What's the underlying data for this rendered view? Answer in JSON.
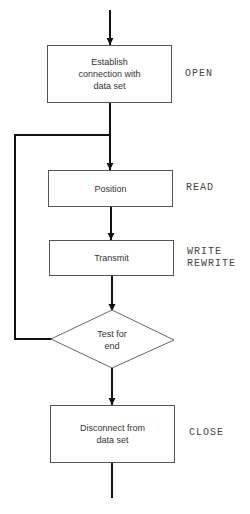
{
  "diagram": {
    "type": "flowchart",
    "nodes": [
      {
        "id": "establish",
        "shape": "rect",
        "text": "Establish connection with data set",
        "lines": [
          "Establish",
          "connection with",
          "data set"
        ],
        "annotation": "OPEN"
      },
      {
        "id": "position",
        "shape": "rect",
        "text": "Position",
        "annotation": "READ"
      },
      {
        "id": "transmit",
        "shape": "rect",
        "text": "Transmit",
        "annotation_lines": [
          "WRITE",
          "REWRITE"
        ]
      },
      {
        "id": "test",
        "shape": "diamond",
        "lines": [
          "Test for",
          "end"
        ]
      },
      {
        "id": "disconnect",
        "shape": "rect",
        "lines": [
          "Disconnect from",
          "data set"
        ],
        "annotation": "CLOSE"
      }
    ],
    "edges": [
      {
        "from": "start",
        "to": "establish"
      },
      {
        "from": "establish",
        "to": "position"
      },
      {
        "from": "position",
        "to": "transmit"
      },
      {
        "from": "transmit",
        "to": "test"
      },
      {
        "from": "test",
        "to": "position",
        "label": "loop back"
      },
      {
        "from": "test",
        "to": "disconnect"
      },
      {
        "from": "disconnect",
        "to": "end"
      }
    ]
  },
  "boxes": {
    "establish": "Establish\nconnection with\ndata set",
    "position": "Position",
    "transmit": "Transmit",
    "test": "Test for\nend",
    "disconnect": "Disconnect from\ndata set"
  },
  "annotations": {
    "open": "OPEN",
    "read": "READ",
    "write": "WRITE\nREWRITE",
    "close": "CLOSE"
  }
}
